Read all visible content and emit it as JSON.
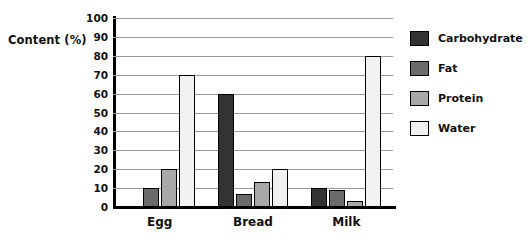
{
  "chart_data": {
    "type": "bar",
    "title": "",
    "xlabel": "",
    "ylabel": "Content (%)",
    "ylim": [
      0,
      100
    ],
    "yticks": [
      0,
      10,
      20,
      30,
      40,
      50,
      60,
      70,
      80,
      90,
      100
    ],
    "ytick_labels": [
      "0",
      "10",
      "20",
      "30",
      "40",
      "50",
      "60",
      "70",
      "80",
      "90",
      "100"
    ],
    "grid": "horizontal",
    "legend_position": "right",
    "categories": [
      "Egg",
      "Bread",
      "Milk"
    ],
    "series": [
      {
        "name": "Carbohydrate",
        "color": "#333333",
        "values": [
          0,
          60,
          10
        ]
      },
      {
        "name": "Fat",
        "color": "#6b6b6b",
        "values": [
          10,
          7,
          9
        ]
      },
      {
        "name": "Protein",
        "color": "#a8a8a8",
        "values": [
          20,
          13,
          3
        ]
      },
      {
        "name": "Water",
        "color": "#f2f2f2",
        "values": [
          70,
          20,
          80
        ]
      }
    ]
  },
  "axis": {
    "y_title": "Content (%)"
  },
  "colors": {
    "axis": "#000000",
    "gridline": "#9a9a9a",
    "background": "#ffffff",
    "bar_outline": "#000000"
  }
}
